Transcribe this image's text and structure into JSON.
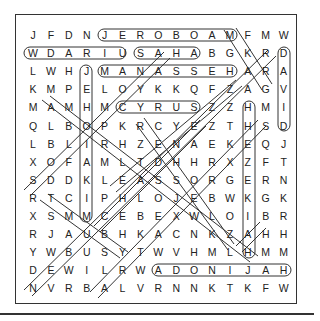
{
  "puzzle": {
    "rows": 15,
    "cols": 15,
    "grid": [
      [
        "J",
        "F",
        "D",
        "N",
        "J",
        "E",
        "R",
        "O",
        "B",
        "O",
        "A",
        "M",
        "F",
        "M",
        "W"
      ],
      [
        "W",
        "D",
        "A",
        "R",
        "I",
        "U",
        "S",
        "A",
        "H",
        "A",
        "B",
        "G",
        "K",
        "R",
        "D"
      ],
      [
        "L",
        "W",
        "H",
        "J",
        "M",
        "A",
        "N",
        "A",
        "S",
        "S",
        "E",
        "H",
        "A",
        "R",
        "A"
      ],
      [
        "K",
        "M",
        "P",
        "E",
        "L",
        "O",
        "Y",
        "K",
        "K",
        "Q",
        "F",
        "Z",
        "A",
        "G",
        "V"
      ],
      [
        "M",
        "A",
        "M",
        "H",
        "M",
        "C",
        "Y",
        "R",
        "U",
        "S",
        "Z",
        "Z",
        "H",
        "M",
        "I"
      ],
      [
        "Q",
        "L",
        "B",
        "O",
        "P",
        "K",
        "R",
        "C",
        "Y",
        "E",
        "Z",
        "T",
        "H",
        "S",
        "D"
      ],
      [
        "L",
        "B",
        "L",
        "I",
        "R",
        "H",
        "Z",
        "E",
        "N",
        "A",
        "E",
        "K",
        "E",
        "Q",
        "J"
      ],
      [
        "X",
        "O",
        "F",
        "A",
        "M",
        "L",
        "T",
        "D",
        "H",
        "H",
        "R",
        "X",
        "Z",
        "F",
        "T"
      ],
      [
        "S",
        "D",
        "D",
        "K",
        "L",
        "E",
        "A",
        "S",
        "S",
        "O",
        "R",
        "G",
        "E",
        "R",
        "N"
      ],
      [
        "R",
        "T",
        "C",
        "I",
        "P",
        "H",
        "L",
        "O",
        "J",
        "E",
        "B",
        "W",
        "K",
        "G",
        "K"
      ],
      [
        "X",
        "S",
        "M",
        "M",
        "C",
        "E",
        "B",
        "E",
        "X",
        "W",
        "L",
        "O",
        "I",
        "B",
        "R"
      ],
      [
        "R",
        "J",
        "A",
        "U",
        "B",
        "H",
        "K",
        "A",
        "C",
        "N",
        "K",
        "Z",
        "A",
        "H",
        "H"
      ],
      [
        "Y",
        "W",
        "B",
        "U",
        "S",
        "Y",
        "T",
        "W",
        "V",
        "H",
        "M",
        "L",
        "H",
        "M",
        "M"
      ],
      [
        "D",
        "E",
        "W",
        "I",
        "L",
        "R",
        "W",
        "A",
        "D",
        "O",
        "N",
        "I",
        "J",
        "A",
        "H"
      ],
      [
        "N",
        "V",
        "R",
        "B",
        "A",
        "L",
        "V",
        "R",
        "N",
        "N",
        "K",
        "T",
        "K",
        "F",
        "W"
      ]
    ],
    "found_words": [
      {
        "word": "JEROBOAM",
        "start": [
          0,
          4
        ],
        "end": [
          0,
          11
        ]
      },
      {
        "word": "DARIUS",
        "start": [
          1,
          1
        ],
        "end": [
          1,
          6
        ]
      },
      {
        "word": "AHAB",
        "start": [
          1,
          7
        ],
        "end": [
          1,
          10
        ]
      },
      {
        "word": "MANASSEH",
        "start": [
          2,
          4
        ],
        "end": [
          2,
          11
        ]
      },
      {
        "word": "CYRUS",
        "start": [
          4,
          5
        ],
        "end": [
          4,
          9
        ]
      },
      {
        "word": "ADONIJAH",
        "start": [
          13,
          7
        ],
        "end": [
          13,
          14
        ]
      },
      {
        "word": "DAVID",
        "start": [
          1,
          14
        ],
        "end": [
          5,
          14
        ]
      },
      {
        "word": "JEHOIAKIM",
        "start": [
          2,
          3
        ],
        "end": [
          9,
          3
        ]
      },
      {
        "word": "HEZEKIAH",
        "start": [
          5,
          12
        ],
        "end": [
          12,
          12
        ]
      },
      {
        "word": "AMAZIAH",
        "start": [
          0,
          10
        ],
        "end": [
          3,
          13
        ]
      },
      {
        "word": "ABIJAH",
        "start": [
          4,
          1
        ],
        "end": [
          12,
          9
        ]
      },
      {
        "word": "SOLOMON",
        "start": [
          10,
          1
        ],
        "end": [
          13,
          4
        ]
      },
      {
        "word": "NADAB",
        "start": [
          14,
          0
        ],
        "end": [
          2,
          6
        ]
      },
      {
        "word": "REHOBOAM",
        "start": [
          1,
          13
        ],
        "end": [
          8,
          5
        ]
      },
      {
        "word": "ZEDEKIAH",
        "start": [
          4,
          10
        ],
        "end": [
          14,
          4
        ]
      },
      {
        "word": "SAUL",
        "start": [
          5,
          13
        ],
        "end": [
          13,
          4
        ]
      },
      {
        "word": "RUTH",
        "start": [
          5,
          6
        ],
        "end": [
          12,
          12
        ]
      },
      {
        "word": "BAASHA",
        "start": [
          11,
          4
        ],
        "end": [
          2,
          12
        ]
      }
    ]
  }
}
